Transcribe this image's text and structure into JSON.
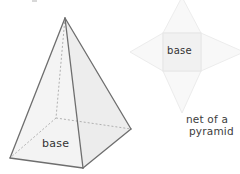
{
  "figure": {
    "title_alt": "Square pyramid and its net",
    "colors": {
      "background": "#ffffff",
      "solid_edge": "#6b6b6b",
      "solid_edge_dark": "#5a5a5a",
      "hidden_edge": "#9a9a9a",
      "face_light": "#f4f4f4",
      "face_mid": "#eeeeee",
      "face_dark": "#e6e6e6",
      "base_face": "#e8e8e8",
      "net_fill": "#f7f7f7",
      "net_square_fill": "#f0f0f0",
      "net_stroke": "#ededed",
      "text": "#333333"
    }
  },
  "pyramid": {
    "name": "square-pyramid-3d",
    "base_label": "base",
    "apex": {
      "x": 65,
      "y": 18
    },
    "base_vertices": {
      "front": {
        "x": 83,
        "y": 168
      },
      "left": {
        "x": 10,
        "y": 158
      },
      "back": {
        "x": 56,
        "y": 118
      },
      "right": {
        "x": 131,
        "y": 129
      }
    }
  },
  "net": {
    "name": "pyramid-net",
    "base_label": "base",
    "caption_line_1": "net of a",
    "caption_line_2": "pyramid",
    "square": {
      "x": 163,
      "y": 33,
      "width": 38,
      "height": 38
    },
    "triangles": [
      {
        "name": "net-triangle-top",
        "tip_x": 182,
        "tip_y": -2
      },
      {
        "name": "net-triangle-bottom",
        "tip_x": 182,
        "tip_y": 112
      },
      {
        "name": "net-triangle-left",
        "tip_x": 131,
        "tip_y": 52
      },
      {
        "name": "net-triangle-right",
        "tip_x": 243,
        "tip_y": 52
      }
    ]
  }
}
